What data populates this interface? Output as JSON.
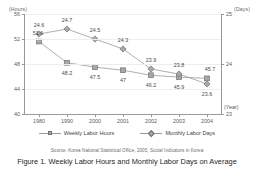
{
  "figure": {
    "caption": "Figure 1.  Weekly Labor Hours and Monthly Labor Days on Average",
    "source": "Source: Korea National Statistical Office, 2005, Social Indicators in Korea",
    "clipped_title": ""
  },
  "colors": {
    "marker_fill": "#a8a8a8",
    "marker_stroke": "#6f6f6f",
    "line": "#9a9a9a",
    "axis": "#9a9a9a",
    "grid": "#ededed",
    "text": "#3a3a3a"
  },
  "legend": {
    "position": "bottom-center",
    "items": [
      {
        "label": "Weekly Labor Hours",
        "marker": "square-marker-icon"
      },
      {
        "label": "Monthly Labor Days",
        "marker": "diamond-marker-icon"
      }
    ]
  },
  "axes": {
    "left_unit": "(Hours)",
    "right_unit": "(Days)",
    "x_unit": "(Year)",
    "left_ticks": [
      "56",
      "52",
      "48",
      "44",
      "40"
    ],
    "right_ticks": [
      "25",
      "24",
      "23"
    ]
  },
  "chart_data": {
    "type": "line",
    "title": "Figure 1.  Weekly Labor Hours and Monthly Labor Days on Average",
    "xlabel": "(Year)",
    "ylabel": "(Hours)",
    "y2label": "(Days)",
    "ylim": [
      40,
      56
    ],
    "y2lim": [
      23,
      25
    ],
    "yticks": [
      40,
      44,
      48,
      52,
      56
    ],
    "y2ticks": [
      23,
      24,
      25
    ],
    "grid": true,
    "legend": "bottom-center",
    "categories": [
      "1980",
      "1990",
      "2000",
      "2001",
      "2002",
      "2003",
      "2004"
    ],
    "series": [
      {
        "name": "Weekly Labor Hours",
        "axis": "left",
        "marker": "square",
        "values": [
          51.6,
          48.2,
          47.5,
          47,
          46.2,
          45.9,
          45.7
        ],
        "labels": [
          "51.6",
          "48.2",
          "47.5",
          "47",
          "46.2",
          "45.9",
          "45.7"
        ]
      },
      {
        "name": "Monthly Labor Days",
        "axis": "right",
        "marker": "diamond",
        "values": [
          24.6,
          24.7,
          24.5,
          24.3,
          23.9,
          23.8,
          23.6
        ],
        "labels": [
          "24.6",
          "24.7",
          "24.5",
          "24.3",
          "23.9",
          "23.8",
          "23.6"
        ]
      }
    ]
  }
}
